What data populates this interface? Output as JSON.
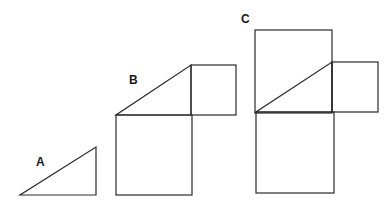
{
  "diagram": {
    "figures": [
      {
        "label": "A",
        "label_pos": [
          36,
          166
        ],
        "shapes": [
          {
            "type": "triangle",
            "points": [
              [
                20,
                195
              ],
              [
                96,
                195
              ],
              [
                96,
                147
              ]
            ]
          }
        ]
      },
      {
        "label": "B",
        "label_pos": [
          129,
          84
        ],
        "shapes": [
          {
            "type": "triangle",
            "points": [
              [
                116,
                115
              ],
              [
                191,
                115
              ],
              [
                191,
                65
              ]
            ]
          },
          {
            "type": "square",
            "x": 191,
            "y": 65,
            "w": 45,
            "h": 50
          },
          {
            "type": "square",
            "x": 116,
            "y": 115,
            "w": 76,
            "h": 80
          }
        ]
      },
      {
        "label": "C",
        "label_pos": [
          241,
          23
        ],
        "shapes": [
          {
            "type": "rect",
            "x": 255,
            "y": 30,
            "w": 77,
            "h": 83
          },
          {
            "type": "triangle",
            "points": [
              [
                256,
                112
              ],
              [
                332,
                112
              ],
              [
                332,
                62
              ]
            ]
          },
          {
            "type": "square",
            "x": 332,
            "y": 62,
            "w": 46,
            "h": 50
          },
          {
            "type": "square",
            "x": 256,
            "y": 112,
            "w": 78,
            "h": 81
          }
        ]
      }
    ]
  }
}
